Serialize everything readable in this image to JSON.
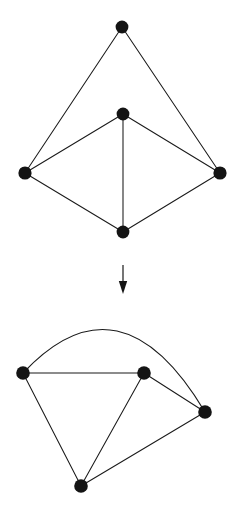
{
  "figure": {
    "background_color": "#ffffff",
    "ink_color": "#141414",
    "width": 238,
    "height": 513
  },
  "top_graph": {
    "name": "source-graph",
    "vertex_count": 5,
    "edge_count": 7,
    "vertices": [
      {
        "id": "apex",
        "label": "",
        "cx": 122,
        "cy": 27,
        "r": 6.4
      },
      {
        "id": "center",
        "label": "",
        "cx": 123,
        "cy": 114,
        "r": 6.4
      },
      {
        "id": "left",
        "label": "",
        "cx": 25,
        "cy": 173,
        "r": 6.6
      },
      {
        "id": "right",
        "label": "",
        "cx": 220,
        "cy": 173,
        "r": 6.6
      },
      {
        "id": "bottom",
        "label": "",
        "cx": 123,
        "cy": 232,
        "r": 6.4
      }
    ],
    "edges": [
      {
        "from": "apex",
        "to": "left",
        "shape": "line"
      },
      {
        "from": "apex",
        "to": "right",
        "shape": "line"
      },
      {
        "from": "center",
        "to": "left",
        "shape": "line"
      },
      {
        "from": "center",
        "to": "right",
        "shape": "line"
      },
      {
        "from": "center",
        "to": "bottom",
        "shape": "line"
      },
      {
        "from": "left",
        "to": "bottom",
        "shape": "line"
      },
      {
        "from": "right",
        "to": "bottom",
        "shape": "line"
      }
    ]
  },
  "arrow": {
    "name": "downward-transform-arrow",
    "direction": "down",
    "x": 123,
    "y_start": 265,
    "y_end": 294,
    "head_top": 281,
    "head_half_width": 4.2
  },
  "bottom_graph": {
    "name": "result-graph",
    "vertex_count": 4,
    "edge_count": 6,
    "vertices": [
      {
        "id": "left",
        "label": "",
        "cx": 23,
        "cy": 373,
        "r": 6.8
      },
      {
        "id": "middle",
        "label": "",
        "cx": 144,
        "cy": 373,
        "r": 6.8
      },
      {
        "id": "right",
        "label": "",
        "cx": 205,
        "cy": 412,
        "r": 6.8
      },
      {
        "id": "bottom",
        "label": "",
        "cx": 81,
        "cy": 486,
        "r": 6.8
      }
    ],
    "edges": [
      {
        "from": "left",
        "to": "right",
        "shape": "arc",
        "apex_x": 117,
        "apex_y": 331
      },
      {
        "from": "left",
        "to": "middle",
        "shape": "line"
      },
      {
        "from": "left",
        "to": "bottom",
        "shape": "line"
      },
      {
        "from": "middle",
        "to": "right",
        "shape": "line"
      },
      {
        "from": "middle",
        "to": "bottom",
        "shape": "line"
      },
      {
        "from": "right",
        "to": "bottom",
        "shape": "line"
      }
    ]
  }
}
